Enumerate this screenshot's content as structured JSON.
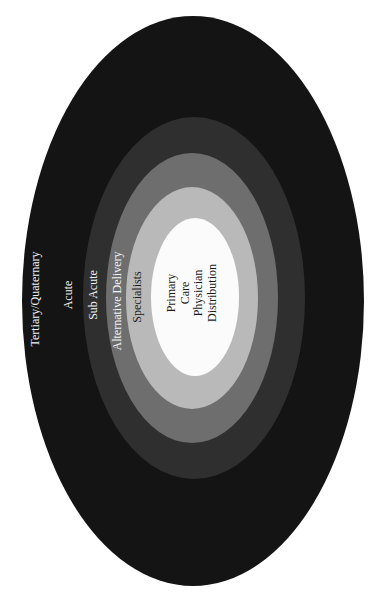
{
  "diagram": {
    "orientation": "rotated -90deg (text reads bottom-to-top)",
    "rings": [
      {
        "id": "tertiary-quaternary",
        "label": "Tertiary/Quaternary",
        "color": "#141414",
        "cx": 193,
        "cy": 301,
        "rx": 171,
        "ry": 285
      },
      {
        "id": "acute",
        "label": "Acute",
        "color": "#141414",
        "cx": 193,
        "cy": 301,
        "rx": 171,
        "ry": 285
      },
      {
        "id": "sub-acute",
        "label": "Sub Acute",
        "color": "#2f2f2f",
        "cx": 194,
        "cy": 298,
        "rx": 111,
        "ry": 181
      },
      {
        "id": "alternative-delivery",
        "label": "Alternative Delivery",
        "color": "#6e6e6e",
        "cx": 192,
        "cy": 298,
        "rx": 86,
        "ry": 145
      },
      {
        "id": "specialists",
        "label": "Specialists",
        "color": "#b9b9b9",
        "cx": 192,
        "cy": 298,
        "rx": 66,
        "ry": 111
      },
      {
        "id": "primary-care",
        "label": "Primary Care Physician Distribution",
        "color": "#fbfbfb",
        "cx": 195,
        "cy": 297,
        "rx": 44,
        "ry": 79
      }
    ],
    "labels": {
      "tertiary_quaternary": "Tertiary/Quaternary",
      "acute": "Acute",
      "sub_acute": "Sub Acute",
      "alternative_delivery": "Alternative Delivery",
      "specialists": "Specialists",
      "center": {
        "line1": "Primary",
        "line2": "Care",
        "line3": "Physician",
        "line4": "Distribution"
      }
    }
  }
}
